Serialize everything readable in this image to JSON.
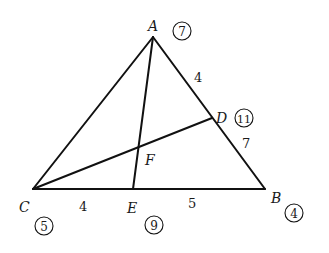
{
  "diagram": {
    "points": {
      "A": {
        "label": "A",
        "badge": "7"
      },
      "B": {
        "label": "B",
        "badge": "4"
      },
      "C": {
        "label": "C",
        "badge": "5"
      },
      "D": {
        "label": "D",
        "badge": "11"
      },
      "E": {
        "label": "E",
        "badge": "9"
      },
      "F": {
        "label": "F"
      }
    },
    "segments": {
      "AD": "4",
      "DB": "7",
      "CE": "4",
      "EB": "5"
    }
  }
}
